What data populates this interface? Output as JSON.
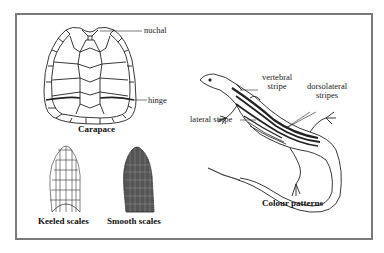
{
  "figure": {
    "panels": {
      "carapace": {
        "caption": "Carapace",
        "labels": {
          "nuchal": "nuchal",
          "hinge": "hinge"
        }
      },
      "keeled": {
        "caption": "Keeled scales"
      },
      "smooth": {
        "caption": "Smooth scales"
      },
      "colour_patterns": {
        "caption": "Colour patterns",
        "labels": {
          "vertebral_line1": "vertebral",
          "vertebral_line2": "stripe",
          "dorsolateral_line1": "dorsolateral",
          "dorsolateral_line2": "stripes",
          "lateral": "lateral stripe"
        }
      }
    },
    "colors": {
      "frame": "#7a7a7a",
      "ink": "#222222",
      "background": "#ffffff"
    }
  }
}
